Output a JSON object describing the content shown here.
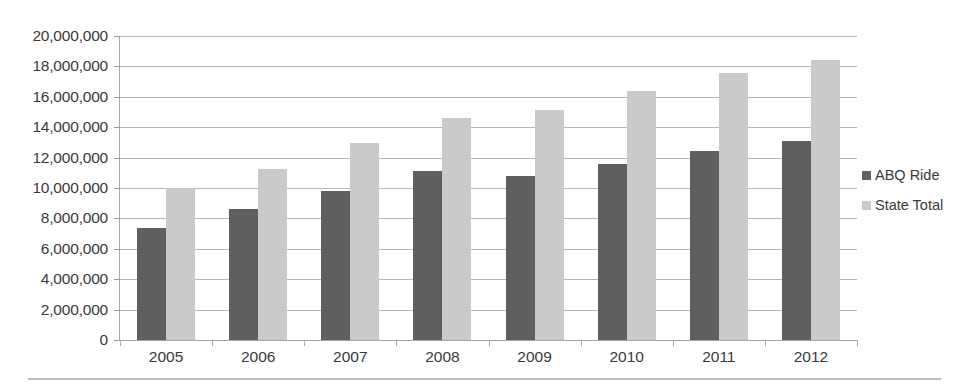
{
  "chart_data": {
    "type": "bar",
    "title": "",
    "subtitle": "",
    "xlabel": "",
    "ylabel": "",
    "categories": [
      "2005",
      "2006",
      "2007",
      "2008",
      "2009",
      "2010",
      "2011",
      "2012"
    ],
    "series": [
      {
        "name": "ABQ Ride",
        "color": "#5f5f5f",
        "values": [
          7400000,
          8600000,
          9800000,
          11100000,
          10800000,
          11600000,
          12450000,
          13100000
        ]
      },
      {
        "name": "State Total",
        "color": "#cacaca",
        "values": [
          10000000,
          11250000,
          12950000,
          14600000,
          15150000,
          16400000,
          17550000,
          18400000
        ]
      }
    ],
    "ylim": [
      0,
      20000000
    ],
    "ytick_step": 2000000,
    "ytick_labels": [
      "20,000,000",
      "18,000,000",
      "16,000,000",
      "14,000,000",
      "12,000,000",
      "10,000,000",
      "8,000,000",
      "6,000,000",
      "4,000,000",
      "2,000,000",
      "0"
    ],
    "ytick_values": [
      20000000,
      18000000,
      16000000,
      14000000,
      12000000,
      10000000,
      8000000,
      6000000,
      4000000,
      2000000,
      0
    ],
    "grid": true,
    "legend_position": "right",
    "legend": [
      "ABQ Ride",
      "State Total"
    ]
  }
}
